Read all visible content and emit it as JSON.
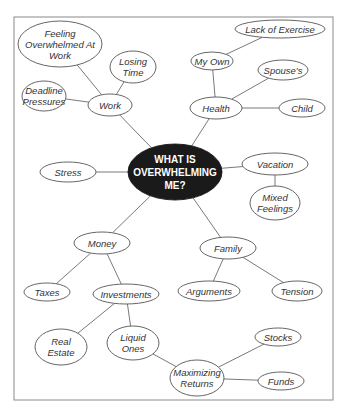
{
  "diagram": {
    "type": "mind-map",
    "central": {
      "id": "center",
      "label": "WHAT IS OVERWHELMING ME?",
      "lines": [
        "WHAT IS",
        "OVERWHELMING",
        "ME?"
      ],
      "x": 175,
      "y": 172,
      "rx": 47,
      "ry": 28
    },
    "nodes": [
      {
        "id": "work",
        "label": "Work",
        "lines": [
          "Work"
        ],
        "x": 110,
        "y": 105,
        "rx": 22,
        "ry": 11
      },
      {
        "id": "feeling-overwhelmed",
        "label": "Feeling Overwhelmed At Work",
        "lines": [
          "Feeling",
          "Overwhelmed At",
          "Work"
        ],
        "x": 60,
        "y": 44,
        "rx": 42,
        "ry": 23
      },
      {
        "id": "losing-time",
        "label": "Losing Time",
        "lines": [
          "Losing",
          "Time"
        ],
        "x": 133,
        "y": 67,
        "rx": 23,
        "ry": 16
      },
      {
        "id": "deadline-pressures",
        "label": "Deadline Pressures",
        "lines": [
          "Deadline",
          "Pressures"
        ],
        "x": 44,
        "y": 96,
        "rx": 22,
        "ry": 15
      },
      {
        "id": "health",
        "label": "Health",
        "lines": [
          "Health"
        ],
        "x": 216,
        "y": 108,
        "rx": 26,
        "ry": 11
      },
      {
        "id": "my-own",
        "label": "My Own",
        "lines": [
          "My Own"
        ],
        "x": 212,
        "y": 61,
        "rx": 21,
        "ry": 9
      },
      {
        "id": "lack-of-exercise",
        "label": "Lack of Exercise",
        "lines": [
          "Lack of Exercise"
        ],
        "x": 280,
        "y": 29,
        "rx": 45,
        "ry": 9
      },
      {
        "id": "spouses",
        "label": "Spouse's",
        "lines": [
          "Spouse's"
        ],
        "x": 283,
        "y": 70,
        "rx": 25,
        "ry": 10
      },
      {
        "id": "child",
        "label": "Child",
        "lines": [
          "Child"
        ],
        "x": 302,
        "y": 108,
        "rx": 23,
        "ry": 9
      },
      {
        "id": "stress",
        "label": "Stress",
        "lines": [
          "Stress"
        ],
        "x": 68,
        "y": 172,
        "rx": 28,
        "ry": 10
      },
      {
        "id": "vacation",
        "label": "Vacation",
        "lines": [
          "Vacation"
        ],
        "x": 275,
        "y": 164,
        "rx": 33,
        "ry": 11
      },
      {
        "id": "mixed-feelings",
        "label": "Mixed Feelings",
        "lines": [
          "Mixed",
          "Feelings"
        ],
        "x": 275,
        "y": 203,
        "rx": 25,
        "ry": 17
      },
      {
        "id": "money",
        "label": "Money",
        "lines": [
          "Money"
        ],
        "x": 102,
        "y": 243,
        "rx": 28,
        "ry": 11
      },
      {
        "id": "family",
        "label": "Family",
        "lines": [
          "Family"
        ],
        "x": 228,
        "y": 248,
        "rx": 28,
        "ry": 11
      },
      {
        "id": "taxes",
        "label": "Taxes",
        "lines": [
          "Taxes"
        ],
        "x": 47,
        "y": 292,
        "rx": 23,
        "ry": 9
      },
      {
        "id": "investments",
        "label": "Investments",
        "lines": [
          "Investments"
        ],
        "x": 126,
        "y": 294,
        "rx": 33,
        "ry": 10
      },
      {
        "id": "arguments",
        "label": "Arguments",
        "lines": [
          "Arguments"
        ],
        "x": 209,
        "y": 291,
        "rx": 31,
        "ry": 10
      },
      {
        "id": "tension",
        "label": "Tension",
        "lines": [
          "Tension"
        ],
        "x": 297,
        "y": 291,
        "rx": 25,
        "ry": 10
      },
      {
        "id": "real-estate",
        "label": "Real Estate",
        "lines": [
          "Real",
          "Estate"
        ],
        "x": 61,
        "y": 347,
        "rx": 26,
        "ry": 18
      },
      {
        "id": "liquid-ones",
        "label": "Liquid Ones",
        "lines": [
          "Liquid",
          "Ones"
        ],
        "x": 133,
        "y": 343,
        "rx": 26,
        "ry": 17
      },
      {
        "id": "maximizing-returns",
        "label": "Maximizing Returns",
        "lines": [
          "Maximizing",
          "Returns"
        ],
        "x": 197,
        "y": 378,
        "rx": 27,
        "ry": 18
      },
      {
        "id": "stocks",
        "label": "Stocks",
        "lines": [
          "Stocks"
        ],
        "x": 278,
        "y": 337,
        "rx": 23,
        "ry": 9
      },
      {
        "id": "funds",
        "label": "Funds",
        "lines": [
          "Funds"
        ],
        "x": 281,
        "y": 381,
        "rx": 23,
        "ry": 9
      }
    ],
    "edges": [
      [
        "center",
        "work"
      ],
      [
        "work",
        "feeling-overwhelmed"
      ],
      [
        "work",
        "losing-time"
      ],
      [
        "work",
        "deadline-pressures"
      ],
      [
        "center",
        "health"
      ],
      [
        "health",
        "my-own"
      ],
      [
        "my-own",
        "lack-of-exercise"
      ],
      [
        "health",
        "spouses"
      ],
      [
        "health",
        "child"
      ],
      [
        "center",
        "stress"
      ],
      [
        "center",
        "vacation"
      ],
      [
        "vacation",
        "mixed-feelings"
      ],
      [
        "center",
        "money"
      ],
      [
        "money",
        "taxes"
      ],
      [
        "money",
        "investments"
      ],
      [
        "investments",
        "real-estate"
      ],
      [
        "investments",
        "liquid-ones"
      ],
      [
        "liquid-ones",
        "maximizing-returns"
      ],
      [
        "maximizing-returns",
        "stocks"
      ],
      [
        "maximizing-returns",
        "funds"
      ],
      [
        "center",
        "family"
      ],
      [
        "family",
        "arguments"
      ],
      [
        "family",
        "tension"
      ]
    ]
  },
  "frame": {
    "x": 14,
    "y": 17,
    "width": 319,
    "height": 383
  }
}
